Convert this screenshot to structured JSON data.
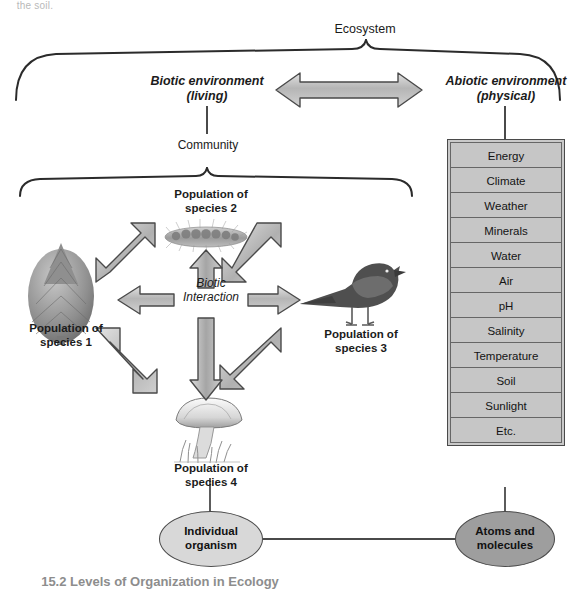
{
  "page": {
    "cropped_header_text": "the soil.",
    "cropped_caption_text": "15.2 Levels of Organization in Ecology"
  },
  "diagram": {
    "title": "Ecosystem",
    "biotic": {
      "label": "Biotic environment\n(living)",
      "community_label": "Community"
    },
    "abiotic": {
      "label": "Abiotic environment\n(physical)",
      "factors": [
        "Energy",
        "Climate",
        "Weather",
        "Minerals",
        "Water",
        "Air",
        "pH",
        "Salinity",
        "Temperature",
        "Soil",
        "Sunlight",
        "Etc."
      ]
    },
    "interaction_label": "Biotic\nInteraction",
    "populations": [
      {
        "id": "species-1",
        "label": "Population of\nspecies 1",
        "organism": "conifer-tree-icon"
      },
      {
        "id": "species-2",
        "label": "Population of\nspecies 2",
        "organism": "caterpillar-icon"
      },
      {
        "id": "species-3",
        "label": "Population of\nspecies 3",
        "organism": "bird-icon"
      },
      {
        "id": "species-4",
        "label": "Population of\nspecies 4",
        "organism": "mushroom-icon"
      }
    ],
    "bottom_nodes": [
      {
        "id": "individual-organism",
        "label": "Individual\norganism",
        "fill": "#d8d8d8"
      },
      {
        "id": "atoms-and-molecules",
        "label": "Atoms and\nmolecules",
        "fill": "#9e9e9e"
      }
    ],
    "colors": {
      "arrow_fill_light": "#d4d4d4",
      "arrow_fill_mid": "#a8a8a8",
      "arrow_stroke": "#4a4a4a",
      "brace_stroke": "#2b2b2b",
      "connector_stroke": "#4a4a4a",
      "box_fill": "#c6c6c6",
      "text": "#1b1b1b"
    }
  }
}
